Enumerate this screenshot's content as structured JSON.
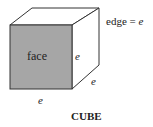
{
  "diagram": {
    "title": "CUBE",
    "face_label": "face",
    "edge_definition": "edge = ",
    "edge_symbol": "e",
    "edge_labels": [
      "e",
      "e",
      "e"
    ],
    "colors": {
      "face_fill": "#a6a6a6",
      "stroke": "#333333",
      "background": "#ffffff"
    }
  }
}
